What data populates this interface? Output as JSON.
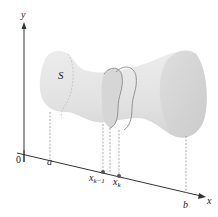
{
  "figure": {
    "type": "solid-of-cross-sections",
    "labels": {
      "y_axis": "y",
      "x_axis": "x",
      "origin": "0",
      "solid": "S",
      "a": "a",
      "b": "b",
      "xk_minus_1_base": "x",
      "xk_minus_1_sub": "k−1",
      "xk_base": "x",
      "xk_sub": "k"
    },
    "colors": {
      "solid_fill": "#e4e4e4",
      "solid_shade": "#d2d2d2",
      "axis": "#333333",
      "slab_outline": "#8a8a8a",
      "dashed": "#888888",
      "point": "#555555"
    }
  }
}
